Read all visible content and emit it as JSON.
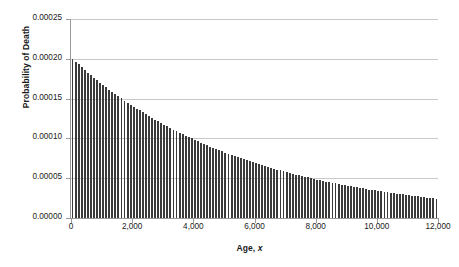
{
  "chart_data": {
    "type": "bar",
    "title": "",
    "xlabel": "Age, x",
    "xlabel_plain": "Age,",
    "xlabel_italic": "x",
    "ylabel": "Probability of Death",
    "xlim": [
      0,
      12000
    ],
    "ylim": [
      0,
      0.00025
    ],
    "grid": true,
    "gridlines_axis": "y",
    "legend": "none",
    "bar_color": "#3b3b3b",
    "gridline_color": "#c9c9c9",
    "axis_color": "#9a9a9a",
    "background_color": "#ffffff",
    "xticks": [
      0,
      2000,
      4000,
      6000,
      8000,
      10000,
      12000
    ],
    "xticklabels": [
      "0",
      "2,000",
      "4,000",
      "6,000",
      "8,000",
      "10,000",
      "12,000"
    ],
    "yticks": [
      0.0,
      5e-05,
      0.0001,
      0.00015,
      0.0002,
      0.00025
    ],
    "yticklabels": [
      "0.00000",
      "0.00005",
      "0.00010",
      "0.00015",
      "0.00020",
      "0.00025"
    ],
    "bar_count": 120,
    "x": [
      50,
      150,
      250,
      350,
      450,
      550,
      650,
      750,
      850,
      950,
      1050,
      1150,
      1250,
      1350,
      1450,
      1550,
      1650,
      1750,
      1850,
      1950,
      2050,
      2150,
      2250,
      2350,
      2450,
      2550,
      2650,
      2750,
      2850,
      2950,
      3050,
      3150,
      3250,
      3350,
      3450,
      3550,
      3650,
      3750,
      3850,
      3950,
      4050,
      4150,
      4250,
      4350,
      4450,
      4550,
      4650,
      4750,
      4850,
      4950,
      5050,
      5150,
      5250,
      5350,
      5450,
      5550,
      5650,
      5750,
      5850,
      5950,
      6050,
      6150,
      6250,
      6350,
      6450,
      6550,
      6650,
      6750,
      6850,
      6950,
      7050,
      7150,
      7250,
      7350,
      7450,
      7550,
      7650,
      7750,
      7850,
      7950,
      8050,
      8150,
      8250,
      8350,
      8450,
      8550,
      8650,
      8750,
      8850,
      8950,
      9050,
      9150,
      9250,
      9350,
      9450,
      9550,
      9650,
      9750,
      9850,
      9950,
      10050,
      10150,
      10250,
      10350,
      10450,
      10550,
      10650,
      10750,
      10850,
      10950,
      11050,
      11150,
      11250,
      11350,
      11450,
      11550,
      11650,
      11750,
      11850,
      11950
    ],
    "values": [
      0.0002,
      0.0001964,
      0.0001929,
      0.0001895,
      0.0001861,
      0.0001828,
      0.0001796,
      0.0001764,
      0.0001733,
      0.0001702,
      0.0001672,
      0.0001643,
      0.0001614,
      0.0001585,
      0.0001557,
      0.000153,
      0.0001503,
      0.0001476,
      0.000145,
      0.0001425,
      0.00014,
      0.0001375,
      0.0001351,
      0.0001327,
      0.0001304,
      0.0001281,
      0.0001258,
      0.0001236,
      0.0001214,
      0.0001193,
      0.0001172,
      0.0001151,
      0.0001131,
      0.0001111,
      0.0001091,
      0.0001072,
      0.0001053,
      0.0001035,
      0.0001017,
      9.99e-05,
      9.81e-05,
      9.64e-05,
      9.47e-05,
      9.3e-05,
      9.14e-05,
      8.98e-05,
      8.82e-05,
      8.66e-05,
      8.51e-05,
      8.36e-05,
      8.21e-05,
      8.07e-05,
      7.93e-05,
      7.79e-05,
      7.65e-05,
      7.51e-05,
      7.38e-05,
      7.25e-05,
      7.13e-05,
      7e-05,
      6.88e-05,
      6.76e-05,
      6.64e-05,
      6.52e-05,
      6.41e-05,
      6.3e-05,
      6.19e-05,
      6.08e-05,
      5.97e-05,
      5.86e-05,
      5.76e-05,
      5.66e-05,
      5.56e-05,
      5.46e-05,
      5.37e-05,
      5.27e-05,
      5.18e-05,
      5.09e-05,
      5e-05,
      4.92e-05,
      4.83e-05,
      4.75e-05,
      4.66e-05,
      4.58e-05,
      4.5e-05,
      4.42e-05,
      4.35e-05,
      4.27e-05,
      4.2e-05,
      4.12e-05,
      4.05e-05,
      3.98e-05,
      3.91e-05,
      3.84e-05,
      3.78e-05,
      3.71e-05,
      3.65e-05,
      3.58e-05,
      3.52e-05,
      3.46e-05,
      3.4e-05,
      3.34e-05,
      3.28e-05,
      3.22e-05,
      3.17e-05,
      3.11e-05,
      3.06e-05,
      3.01e-05,
      2.96e-05,
      2.91e-05,
      2.86e-05,
      2.81e-05,
      2.76e-05,
      2.71e-05,
      2.66e-05,
      2.62e-05,
      2.57e-05,
      2.53e-05,
      2.49e-05,
      2.45e-05
    ]
  }
}
